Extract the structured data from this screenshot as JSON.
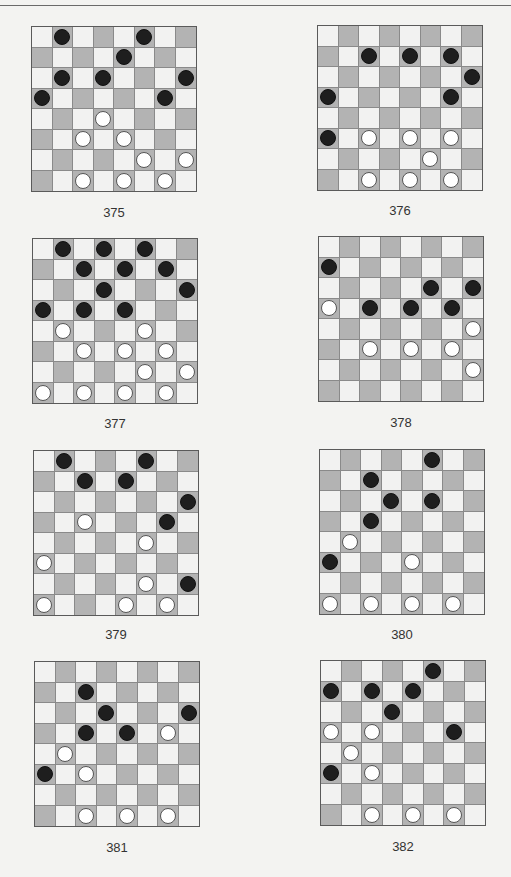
{
  "page": {
    "colors": {
      "dark_square": "#b3b3b3",
      "light_square": "#f2f2f1",
      "black_piece": "#1e1e1e",
      "white_piece": "#ffffff"
    }
  },
  "puzzles": [
    {
      "number": "375",
      "black": [
        [
          0,
          1
        ],
        [
          0,
          5
        ],
        [
          1,
          4
        ],
        [
          2,
          1
        ],
        [
          2,
          3
        ],
        [
          2,
          7
        ],
        [
          3,
          0
        ],
        [
          3,
          6
        ]
      ],
      "white": [
        [
          4,
          3
        ],
        [
          5,
          2
        ],
        [
          5,
          4
        ],
        [
          6,
          5
        ],
        [
          6,
          7
        ],
        [
          7,
          2
        ],
        [
          7,
          4
        ],
        [
          7,
          6
        ]
      ]
    },
    {
      "number": "376",
      "black": [
        [
          1,
          2
        ],
        [
          1,
          4
        ],
        [
          1,
          6
        ],
        [
          2,
          7
        ],
        [
          3,
          0
        ],
        [
          3,
          6
        ],
        [
          5,
          0
        ]
      ],
      "white": [
        [
          5,
          2
        ],
        [
          5,
          4
        ],
        [
          5,
          6
        ],
        [
          6,
          5
        ],
        [
          7,
          2
        ],
        [
          7,
          4
        ],
        [
          7,
          6
        ]
      ]
    },
    {
      "number": "377",
      "black": [
        [
          0,
          1
        ],
        [
          0,
          3
        ],
        [
          0,
          5
        ],
        [
          1,
          2
        ],
        [
          1,
          4
        ],
        [
          1,
          6
        ],
        [
          2,
          3
        ],
        [
          2,
          7
        ],
        [
          3,
          0
        ],
        [
          3,
          2
        ],
        [
          3,
          4
        ]
      ],
      "white": [
        [
          4,
          1
        ],
        [
          4,
          5
        ],
        [
          5,
          2
        ],
        [
          5,
          4
        ],
        [
          5,
          6
        ],
        [
          6,
          5
        ],
        [
          6,
          7
        ],
        [
          7,
          0
        ],
        [
          7,
          2
        ],
        [
          7,
          4
        ],
        [
          7,
          6
        ]
      ]
    },
    {
      "number": "378",
      "black": [
        [
          1,
          0
        ],
        [
          2,
          5
        ],
        [
          2,
          7
        ],
        [
          3,
          2
        ],
        [
          3,
          4
        ],
        [
          3,
          6
        ]
      ],
      "white": [
        [
          3,
          0
        ],
        [
          4,
          7
        ],
        [
          5,
          2
        ],
        [
          5,
          4
        ],
        [
          5,
          6
        ],
        [
          6,
          7
        ]
      ]
    },
    {
      "number": "379",
      "black": [
        [
          0,
          1
        ],
        [
          0,
          5
        ],
        [
          1,
          2
        ],
        [
          1,
          4
        ],
        [
          2,
          7
        ],
        [
          3,
          6
        ],
        [
          6,
          7
        ]
      ],
      "white": [
        [
          3,
          2
        ],
        [
          4,
          5
        ],
        [
          5,
          0
        ],
        [
          6,
          5
        ],
        [
          7,
          0
        ],
        [
          7,
          4
        ],
        [
          7,
          6
        ]
      ]
    },
    {
      "number": "380",
      "black": [
        [
          0,
          5
        ],
        [
          1,
          2
        ],
        [
          2,
          3
        ],
        [
          2,
          5
        ],
        [
          3,
          2
        ],
        [
          5,
          0
        ]
      ],
      "white": [
        [
          4,
          1
        ],
        [
          5,
          4
        ],
        [
          7,
          0
        ],
        [
          7,
          2
        ],
        [
          7,
          4
        ],
        [
          7,
          6
        ]
      ]
    },
    {
      "number": "381",
      "black": [
        [
          1,
          2
        ],
        [
          2,
          3
        ],
        [
          2,
          7
        ],
        [
          3,
          2
        ],
        [
          3,
          4
        ],
        [
          5,
          0
        ]
      ],
      "white": [
        [
          3,
          6
        ],
        [
          4,
          1
        ],
        [
          5,
          2
        ],
        [
          7,
          2
        ],
        [
          7,
          4
        ],
        [
          7,
          6
        ]
      ]
    },
    {
      "number": "382",
      "black": [
        [
          0,
          5
        ],
        [
          1,
          0
        ],
        [
          1,
          2
        ],
        [
          1,
          4
        ],
        [
          2,
          3
        ],
        [
          3,
          6
        ],
        [
          5,
          0
        ]
      ],
      "white": [
        [
          3,
          0
        ],
        [
          3,
          2
        ],
        [
          4,
          1
        ],
        [
          5,
          2
        ],
        [
          7,
          2
        ],
        [
          7,
          4
        ],
        [
          7,
          6
        ]
      ]
    }
  ]
}
